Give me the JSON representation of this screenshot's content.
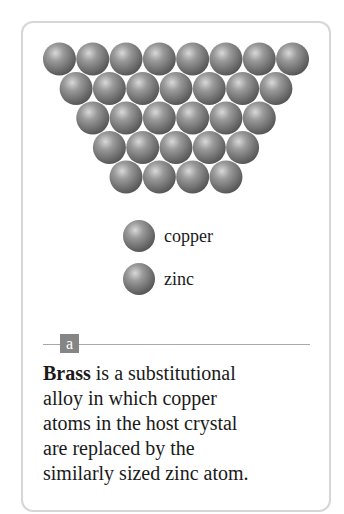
{
  "figure": {
    "panel_label": "a",
    "lattice": {
      "rows": [
        8,
        7,
        6,
        5,
        4
      ],
      "atom_color": "#8a8a8a"
    },
    "legend": [
      {
        "label": "copper",
        "icon": "copper-atom-icon"
      },
      {
        "label": "zinc",
        "icon": "zinc-atom-icon"
      }
    ],
    "caption": {
      "term": "Brass",
      "lines": [
        " is a substitutional",
        "alloy in which copper",
        "atoms in the host crystal",
        "are replaced by the",
        "similarly sized zinc atom."
      ]
    }
  }
}
